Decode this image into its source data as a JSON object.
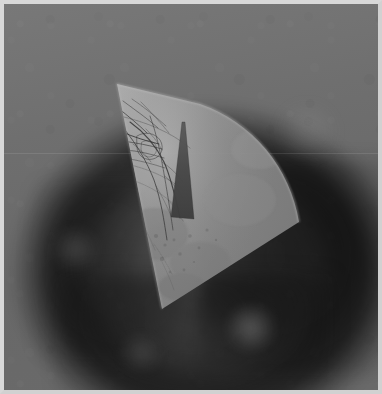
{
  "image": {
    "kind": "medical-scan-frame",
    "modality_appearance": "grayscale angiography / ultrasound sector overlay",
    "width_px": 382,
    "height_px": 394,
    "alt_text": "Grayscale medical scan: a bright triangular fan-shaped sector overlay containing dark branching vessel structures, placed over a dark vignetted circular tissue background."
  },
  "frame": {
    "border_color": "#d8d8d8",
    "border_width_px": 4,
    "canvas_width_px": 374,
    "canvas_height_px": 386
  },
  "background": {
    "base_color": "#6e6e6e",
    "top_color": "#787878",
    "bottom_color": "#6a6a6a",
    "vignette_color": "#0a0a0a",
    "dark_ring_color": "#323232",
    "darkest_pocket_color": "#1e1e1e",
    "glow_color": "#d2d2d2",
    "seam_color": "#ffffff"
  },
  "sector": {
    "name": "ultrasound-fan-sector",
    "fill_color": "#8a8a8a",
    "highlight_color": "#a8a8a8",
    "edge_color": "#b4b4b4",
    "apex_point": "113,80",
    "bottom_vertex": "158,305",
    "arc_right_point": "295,218",
    "arc_top_point": "196,100",
    "opacity": 0.92
  },
  "notch": {
    "name": "shadow-dropout-notch",
    "fill_color": "#4a4a4a",
    "top_point": "178,118",
    "bottom_point": "190,215",
    "width_top_px": 3,
    "width_bottom_px": 22
  },
  "vessels": {
    "name": "vessel-tree",
    "stroke_color": "#2b2b2b",
    "branch_count": 26,
    "region": "upper-left of sector",
    "description": "fine dark branching tubular network with a dense radiating hub"
  },
  "annotations": {
    "has_text_labels": false,
    "has_measurements": false,
    "has_scale_bar": false,
    "visible_text": ""
  }
}
